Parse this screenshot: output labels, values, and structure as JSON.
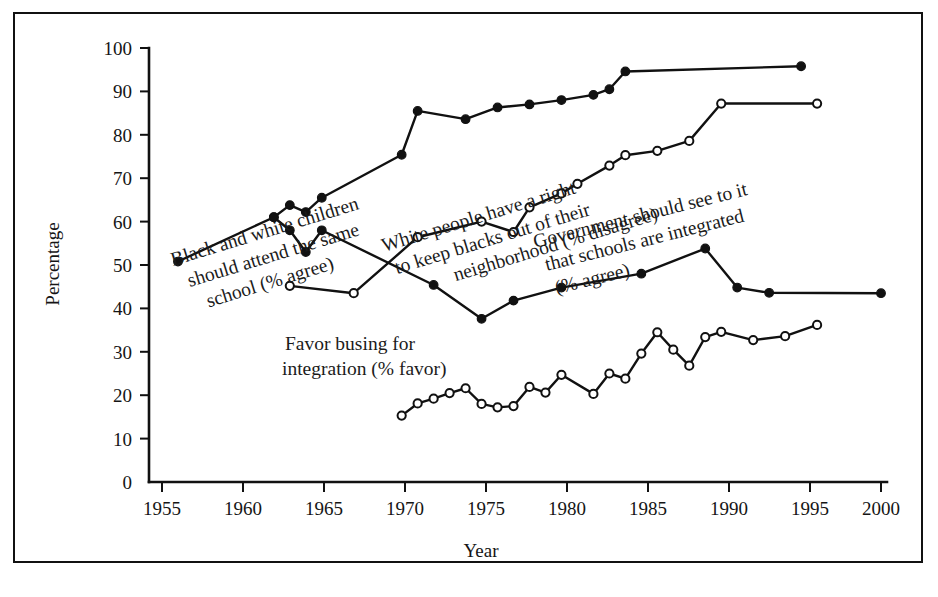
{
  "figure": {
    "border_color": "#111111",
    "background": "#ffffff"
  },
  "chart_data": {
    "type": "line",
    "title": "",
    "xlabel": "Year",
    "ylabel": "Percentage",
    "xlim": [
      1953,
      2001
    ],
    "ylim": [
      0,
      100
    ],
    "xticks": [
      1955,
      1960,
      1965,
      1970,
      1975,
      1980,
      1985,
      1990,
      1995,
      2000
    ],
    "yticks": [
      0,
      10,
      20,
      30,
      40,
      50,
      60,
      70,
      80,
      90,
      100
    ],
    "grid": false,
    "legend": "inline-annotations",
    "line_color": "#111111",
    "series": [
      {
        "name": "Black and white children should attend the same school (% agree)",
        "marker": "filled-circle",
        "points": [
          [
            1956,
            50.8
          ],
          [
            1962,
            61.0
          ],
          [
            1963,
            63.8
          ],
          [
            1964,
            62.2
          ],
          [
            1965,
            65.5
          ],
          [
            1970,
            75.4
          ],
          [
            1971,
            85.5
          ],
          [
            1974,
            83.6
          ],
          [
            1976,
            86.3
          ],
          [
            1978,
            87.0
          ],
          [
            1980,
            88.0
          ],
          [
            1982,
            89.2
          ],
          [
            1983,
            90.5
          ],
          [
            1984,
            94.6
          ],
          [
            1995,
            95.8
          ]
        ]
      },
      {
        "name": "White people have a right to keep blacks out of their neighborhood (% disagree)",
        "marker": "open-circle",
        "points": [
          [
            1963,
            45.2
          ],
          [
            1967,
            43.5
          ],
          [
            1971,
            56.4
          ],
          [
            1975,
            60.0
          ],
          [
            1977,
            57.6
          ],
          [
            1978,
            63.3
          ],
          [
            1980,
            66.5
          ],
          [
            1981,
            68.7
          ],
          [
            1983,
            72.9
          ],
          [
            1984,
            75.3
          ],
          [
            1986,
            76.3
          ],
          [
            1988,
            78.6
          ],
          [
            1990,
            87.2
          ],
          [
            1996,
            87.2
          ]
        ]
      },
      {
        "name": "Government should see to it that schools are integrated (% agree)",
        "marker": "filled-circle",
        "points": [
          [
            1962,
            61.0
          ],
          [
            1963,
            58.0
          ],
          [
            1964,
            53.0
          ],
          [
            1965,
            58.0
          ],
          [
            1972,
            45.4
          ],
          [
            1975,
            37.6
          ],
          [
            1977,
            41.8
          ],
          [
            1980,
            44.8
          ],
          [
            1985,
            48.0
          ],
          [
            1989,
            53.8
          ],
          [
            1991,
            44.8
          ],
          [
            1993,
            43.6
          ],
          [
            2000,
            43.5
          ]
        ]
      },
      {
        "name": "Favor busing for integration (% favor)",
        "marker": "open-circle",
        "points": [
          [
            1970,
            15.3
          ],
          [
            1971,
            18.1
          ],
          [
            1972,
            19.2
          ],
          [
            1973,
            20.5
          ],
          [
            1974,
            21.6
          ],
          [
            1975,
            18.0
          ],
          [
            1976,
            17.2
          ],
          [
            1977,
            17.5
          ],
          [
            1978,
            21.9
          ],
          [
            1979,
            20.6
          ],
          [
            1980,
            24.7
          ],
          [
            1982,
            20.3
          ],
          [
            1983,
            25.0
          ],
          [
            1984,
            23.8
          ],
          [
            1985,
            29.6
          ],
          [
            1986,
            34.5
          ],
          [
            1987,
            30.5
          ],
          [
            1988,
            26.8
          ],
          [
            1989,
            33.4
          ],
          [
            1990,
            34.6
          ],
          [
            1992,
            32.7
          ],
          [
            1994,
            33.6
          ],
          [
            1996,
            36.2
          ]
        ]
      }
    ],
    "annotations": [
      {
        "id": "annotation-black-white-children",
        "lines": [
          "Black and white children",
          "should attend the same",
          "school (% agree)"
        ],
        "rotation": -17
      },
      {
        "id": "annotation-white-people-right",
        "lines": [
          "White people have a right",
          "to keep blacks out of their",
          "neighborhood (% disagree)"
        ],
        "rotation": -17
      },
      {
        "id": "annotation-government-schools",
        "lines": [
          "Government should see to it",
          "that schools are integrated",
          "(% agree)"
        ],
        "rotation": -14
      },
      {
        "id": "annotation-favor-busing",
        "lines": [
          "Favor busing for",
          "integration (% favor)"
        ],
        "rotation": 0
      }
    ]
  }
}
